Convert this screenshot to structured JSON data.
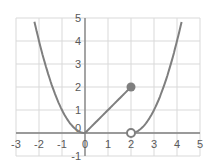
{
  "chart_data": {
    "type": "line",
    "title": "",
    "xlabel": "",
    "ylabel": "",
    "xlim": [
      -3,
      5
    ],
    "ylim": [
      -1,
      5
    ],
    "grid": true,
    "legend": null,
    "x_ticks": [
      "-3",
      "-2",
      "-1",
      "0",
      "1",
      "2",
      "3",
      "4",
      "5"
    ],
    "y_ticks": [
      "5",
      "4",
      "3",
      "2",
      "1",
      "0",
      "-1"
    ],
    "series": [
      {
        "name": "piece-1: y = x^2 (x <= 0)",
        "x": [
          -2.24,
          -2,
          -1.5,
          -1,
          -0.5,
          0
        ],
        "y": [
          5,
          4,
          2.25,
          1,
          0.25,
          0
        ]
      },
      {
        "name": "piece-2: y = x (0 <= x <= 2)",
        "x": [
          0,
          2
        ],
        "y": [
          0,
          2
        ]
      },
      {
        "name": "piece-3: y = (x-2)^2 (x > 2)",
        "x": [
          2,
          2.5,
          3,
          3.5,
          4,
          4.24
        ],
        "y": [
          0,
          0.25,
          1,
          2.25,
          4,
          5
        ]
      }
    ],
    "points": [
      {
        "x": 2,
        "y": 2,
        "style": "filled"
      },
      {
        "x": 2,
        "y": 0,
        "style": "open"
      }
    ],
    "colors": {
      "curve": "#7f7f7f",
      "grid": "#d9d9d9",
      "axis": "#7f7f7f",
      "text": "#595959"
    }
  }
}
